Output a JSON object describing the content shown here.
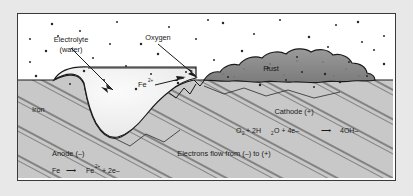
{
  "figure": {
    "title_alt": "Electrochemical corrosion (rusting) of iron",
    "background_color": "#e8e8e8",
    "panel_color": "#ffffff",
    "border_color": "#3a3a3a"
  },
  "colors": {
    "iron_fill": "#c8c8c8",
    "iron_hatch": "#3c3c3c",
    "water_fill": "#f2f2f2",
    "rust_fill": "#8a8a8a",
    "outline": "#1a1a1a",
    "oxygen_dot": "#2a2a2a",
    "text": "#1a1a1a"
  },
  "labels": {
    "electrolyte_line1": "Electrolyte",
    "electrolyte_line2": "(water)",
    "oxygen": "Oxygen",
    "rust": "Rust",
    "iron": "Iron",
    "ferrous_ion_symbol": "Fe",
    "ferrous_ion_charge": "2+"
  },
  "anode": {
    "heading": "Anode (–)",
    "equation_reactant": "Fe",
    "equation_arrow": "⟶",
    "equation_product_symbol": "Fe",
    "equation_product_charge": "2+",
    "equation_product_tail": "+ 2e–"
  },
  "cathode": {
    "heading": "Cathode (+)",
    "eq_o": "O",
    "eq_o_sub": "2",
    "eq_plus1": "+ 2H",
    "eq_h_sub": "2",
    "eq_o2": "O + 4e–",
    "eq_arrow": "⟶",
    "eq_product": "4OH–"
  },
  "electrons": {
    "flow_text": "Electrons flow from (–) to (+)"
  },
  "oxygen_dots": [
    [
      34,
      10
    ],
    [
      62,
      17
    ],
    [
      99,
      8
    ],
    [
      123,
      30
    ],
    [
      151,
      13
    ],
    [
      178,
      25
    ],
    [
      205,
      9
    ],
    [
      236,
      20
    ],
    [
      262,
      6
    ],
    [
      291,
      23
    ],
    [
      318,
      11
    ],
    [
      344,
      28
    ],
    [
      28,
      37
    ],
    [
      75,
      44
    ],
    [
      108,
      52
    ],
    [
      140,
      40
    ],
    [
      168,
      58
    ],
    [
      196,
      46
    ],
    [
      224,
      37
    ],
    [
      250,
      54
    ],
    [
      279,
      43
    ],
    [
      307,
      60
    ],
    [
      331,
      48
    ],
    [
      356,
      36
    ],
    [
      18,
      62
    ],
    [
      52,
      70
    ],
    [
      86,
      66
    ],
    [
      118,
      75
    ],
    [
      40,
      22
    ],
    [
      210,
      63
    ],
    [
      242,
      71
    ],
    [
      268,
      66
    ],
    [
      296,
      73
    ],
    [
      322,
      68
    ],
    [
      349,
      62
    ],
    [
      366,
      22
    ],
    [
      366,
      50
    ],
    [
      12,
      25
    ],
    [
      12,
      48
    ],
    [
      66,
      57
    ],
    [
      190,
      6
    ],
    [
      133,
      60
    ],
    [
      160,
      69
    ],
    [
      284,
      58
    ],
    [
      310,
      33
    ],
    [
      340,
      8
    ],
    [
      92,
      30
    ]
  ],
  "geometry": {
    "surface_y": 66,
    "panel_w": 375,
    "panel_h": 164
  }
}
